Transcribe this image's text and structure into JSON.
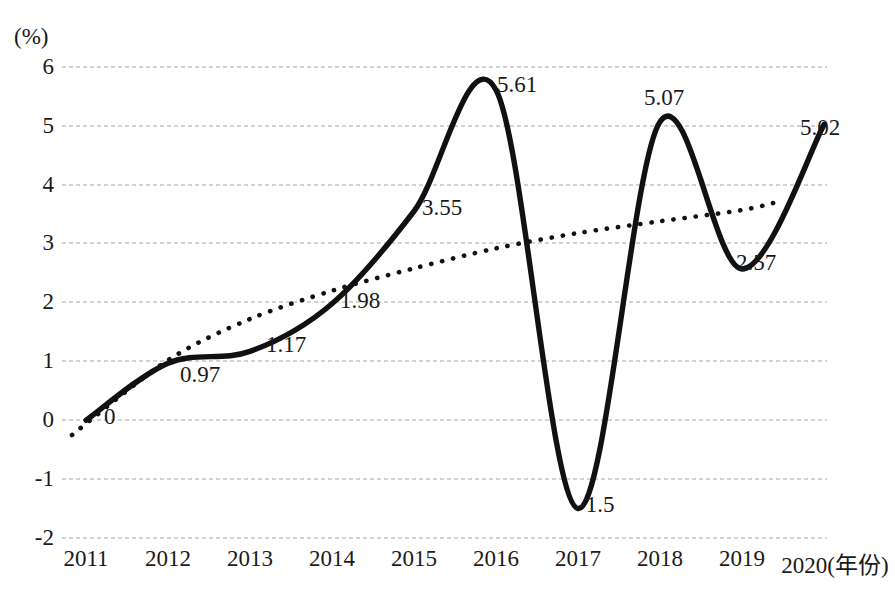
{
  "chart_data": {
    "type": "line",
    "title": "",
    "xlabel": "(年份)",
    "ylabel": "(%)",
    "ylim": [
      -2,
      6
    ],
    "grid": true,
    "legend": "none",
    "categories": [
      "2011",
      "2012",
      "2013",
      "2014",
      "2015",
      "2016",
      "2017",
      "2018",
      "2019",
      "2020"
    ],
    "ytick_labels": [
      "6",
      "5",
      "4",
      "3",
      "2",
      "1",
      "0",
      "-1",
      "-2"
    ],
    "ytick_values": [
      6,
      5,
      4,
      3,
      2,
      1,
      0,
      -1,
      -2
    ],
    "series": [
      {
        "name": "增长率",
        "style": "solid-thick-smooth",
        "color": "#111111",
        "values": [
          0,
          0.97,
          1.17,
          1.98,
          3.55,
          5.61,
          -1.5,
          5.07,
          2.57,
          5.02
        ],
        "data_labels": [
          "0",
          "0.97",
          "1.17",
          "1.98",
          "3.55",
          "5.61",
          "-1.5",
          "5.07",
          "2.57",
          "5.02"
        ]
      },
      {
        "name": "趋势线",
        "style": "dotted",
        "color": "#111111",
        "values": [
          -0.25,
          1.02,
          1.72,
          2.2,
          2.58,
          2.92,
          3.18,
          3.38,
          3.57,
          3.72
        ]
      }
    ]
  },
  "labels": {
    "y_unit": "(%)",
    "x_axis_suffix": "(年份)",
    "v2011": "0",
    "v2012": "0.97",
    "v2013": "1.17",
    "v2014": "1.98",
    "v2015": "3.55",
    "v2016": "5.61",
    "v2017": "-1.5",
    "v2018": "5.07",
    "v2019": "2.57",
    "v2020": "5.02"
  },
  "xticks": {
    "t0": "2011",
    "t1": "2012",
    "t2": "2013",
    "t3": "2014",
    "t4": "2015",
    "t5": "2016",
    "t6": "2017",
    "t7": "2018",
    "t8": "2019",
    "t9": "2020(年份)"
  },
  "yticks": {
    "y6": "6",
    "y5": "5",
    "y4": "4",
    "y3": "3",
    "y2": "2",
    "y1": "1",
    "y0": "0",
    "ym1": "-1",
    "ym2": "-2"
  },
  "colors": {
    "series_line": "#111111",
    "trend_line": "#111111",
    "gridline": "#c3c3c3",
    "text": "#1a1a1a",
    "background": "#ffffff"
  }
}
